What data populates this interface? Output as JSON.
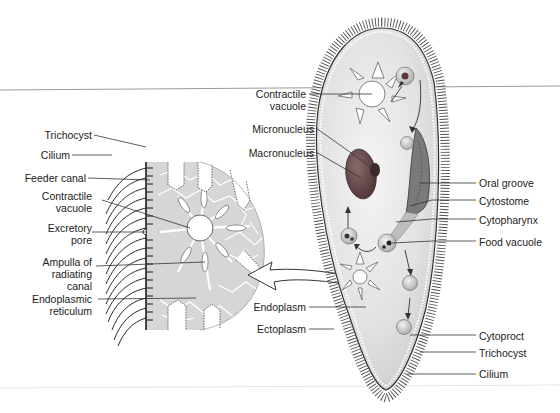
{
  "diagram": {
    "colors": {
      "background": "#ffffff",
      "body_fill": "#e4e4e4",
      "detail_fill": "#d6d6d6",
      "macronucleus": "#6b4b4e",
      "micronucleus": "#3d2a2c",
      "cilia": "#2a2a2a",
      "leader_line": "#333333",
      "rule_line": "#9a9a9a"
    },
    "detail_view": {
      "labels": [
        {
          "id": "trichocyst",
          "lines": [
            "Trichocyst"
          ]
        },
        {
          "id": "cilium",
          "lines": [
            "Cilium"
          ]
        },
        {
          "id": "feeder-canal",
          "lines": [
            "Feeder canal"
          ]
        },
        {
          "id": "contractile-vacuole",
          "lines": [
            "Contractile",
            "vacuole"
          ]
        },
        {
          "id": "excretory-pore",
          "lines": [
            "Excretory",
            "pore"
          ]
        },
        {
          "id": "ampulla",
          "lines": [
            "Ampulla of",
            "radiating",
            "canal"
          ]
        },
        {
          "id": "endoplasmic-reticulum",
          "lines": [
            "Endoplasmic",
            "reticulum"
          ]
        }
      ]
    },
    "organism_view": {
      "left_labels": [
        {
          "id": "contractile-vacuole",
          "lines": [
            "Contractile",
            "vacuole"
          ]
        },
        {
          "id": "micronucleus",
          "lines": [
            "Micronucleus"
          ]
        },
        {
          "id": "macronucleus",
          "lines": [
            "Macronucleus"
          ]
        },
        {
          "id": "endoplasm",
          "lines": [
            "Endoplasm"
          ]
        },
        {
          "id": "ectoplasm",
          "lines": [
            "Ectoplasm"
          ]
        }
      ],
      "right_labels": [
        {
          "id": "oral-groove",
          "lines": [
            "Oral groove"
          ]
        },
        {
          "id": "cytostome",
          "lines": [
            "Cytostome"
          ]
        },
        {
          "id": "cytopharynx",
          "lines": [
            "Cytopharynx"
          ]
        },
        {
          "id": "food-vacuole",
          "lines": [
            "Food vacuole"
          ]
        },
        {
          "id": "cytoproct",
          "lines": [
            "Cytoproct"
          ]
        },
        {
          "id": "trichocyst",
          "lines": [
            "Trichocyst"
          ]
        },
        {
          "id": "cilium",
          "lines": [
            "Cilium"
          ]
        }
      ]
    }
  }
}
